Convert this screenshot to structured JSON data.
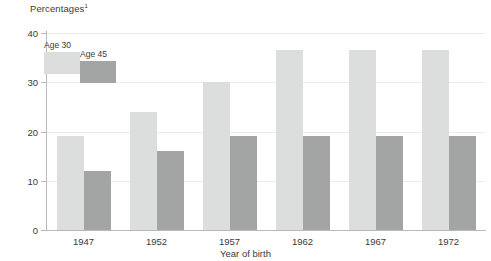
{
  "chart_data": {
    "type": "bar",
    "title": "Percentages",
    "title_superscript": "1",
    "xlabel": "Year of birth",
    "ylabel": "",
    "categories": [
      "1947",
      "1952",
      "1957",
      "1962",
      "1967",
      "1972"
    ],
    "series": [
      {
        "name": "Age 30",
        "color": "#dcdddd",
        "values": [
          19,
          24,
          30,
          36.5,
          36.5,
          36.5
        ]
      },
      {
        "name": "Age 45",
        "color": "#a3a5a5",
        "values": [
          12,
          16,
          19,
          19,
          19,
          19
        ]
      }
    ],
    "ylim": [
      0,
      40
    ],
    "yticks": [
      "0",
      "10",
      "20",
      "30",
      "40"
    ],
    "ytick_values": [
      0,
      10,
      20,
      30,
      40
    ],
    "grid": true,
    "legend_position": "top-left"
  }
}
